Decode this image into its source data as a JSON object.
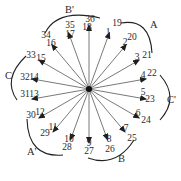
{
  "diagram": {
    "center": [
      89,
      89
    ],
    "arrow_color": "#6a6a6a",
    "text_color": "#2a2a2a",
    "arrows": [
      {
        "angle": -90,
        "len": 64,
        "labels": [
          "18",
          "36"
        ],
        "lx": 87,
        "ly": 30,
        "lx2": 90,
        "ly2": 22
      },
      {
        "angle": -70,
        "len": 60,
        "labels": [
          "1",
          "19"
        ],
        "lx": 108,
        "ly": 35,
        "lx2": 117,
        "ly2": 26
      },
      {
        "angle": -50,
        "len": 58,
        "labels": [
          "2",
          "20"
        ],
        "lx": 125,
        "ly": 45,
        "lx2": 132,
        "ly2": 40
      },
      {
        "angle": -30,
        "len": 58,
        "labels": [
          "3",
          "21"
        ],
        "lx": 137,
        "ly": 60,
        "lx2": 147,
        "ly2": 58
      },
      {
        "angle": -10,
        "len": 58,
        "labels": [
          "4",
          "22"
        ],
        "lx": 143,
        "ly": 78,
        "lx2": 152,
        "ly2": 76
      },
      {
        "angle": 10,
        "len": 58,
        "labels": [
          "5",
          "23"
        ],
        "lx": 143,
        "ly": 95,
        "lx2": 150,
        "ly2": 102
      },
      {
        "angle": 30,
        "len": 58,
        "labels": [
          "6",
          "24"
        ],
        "lx": 138,
        "ly": 116,
        "lx2": 146,
        "ly2": 123
      },
      {
        "angle": 50,
        "len": 56,
        "labels": [
          "7",
          "25"
        ],
        "lx": 126,
        "ly": 131,
        "lx2": 132,
        "ly2": 141
      },
      {
        "angle": 70,
        "len": 54,
        "labels": [
          "8",
          "26"
        ],
        "lx": 109,
        "ly": 142,
        "lx2": 110,
        "ly2": 152
      },
      {
        "angle": 90,
        "len": 54,
        "labels": [
          "9",
          "27"
        ],
        "lx": 89,
        "ly": 146,
        "lx2": 89,
        "ly2": 154
      },
      {
        "angle": 110,
        "len": 54,
        "labels": [
          "10",
          "28"
        ],
        "lx": 69,
        "ly": 142,
        "lx2": 67,
        "ly2": 150
      },
      {
        "angle": 130,
        "len": 56,
        "labels": [
          "11",
          "29"
        ],
        "lx": 53,
        "ly": 130,
        "lx2": 45,
        "ly2": 136
      },
      {
        "angle": 150,
        "len": 58,
        "labels": [
          "12",
          "30"
        ],
        "lx": 40,
        "ly": 115,
        "lx2": 31,
        "ly2": 118
      },
      {
        "angle": 170,
        "len": 58,
        "labels": [
          "13",
          "31"
        ],
        "lx": 34,
        "ly": 97,
        "lx2": 25,
        "ly2": 97
      },
      {
        "angle": 190,
        "len": 58,
        "labels": [
          "14",
          "32"
        ],
        "lx": 34,
        "ly": 80,
        "lx2": 25,
        "ly2": 80
      },
      {
        "angle": 210,
        "len": 58,
        "labels": [
          "15",
          "33"
        ],
        "lx": 41,
        "ly": 61,
        "lx2": 31,
        "ly2": 58
      },
      {
        "angle": 230,
        "len": 58,
        "labels": [
          "16",
          "34"
        ],
        "lx": 51,
        "ly": 46,
        "lx2": 46,
        "ly2": 38
      },
      {
        "angle": 250,
        "len": 60,
        "labels": [
          "17",
          "35"
        ],
        "lx": 70,
        "ly": 37,
        "lx2": 70,
        "ly2": 28
      }
    ],
    "groups": [
      {
        "label": "A",
        "x": 150,
        "y": 28,
        "arc": "M121,23 Q150,18 152,53"
      },
      {
        "label": "B'",
        "x": 65,
        "y": 13,
        "arc": "M45,33 Q58,8 100,18"
      },
      {
        "label": "C",
        "x": 5,
        "y": 79,
        "arc": "M26,56 Q2,79 17,100"
      },
      {
        "label": "C'",
        "x": 167,
        "y": 103,
        "arc": "M160,75 Q180,98 160,120"
      },
      {
        "label": "A'",
        "x": 27,
        "y": 155,
        "arc": "M27,119 Q28,158 63,155"
      },
      {
        "label": "B",
        "x": 118,
        "y": 162,
        "arc": "M88,158 Q116,168 134,140"
      }
    ]
  }
}
